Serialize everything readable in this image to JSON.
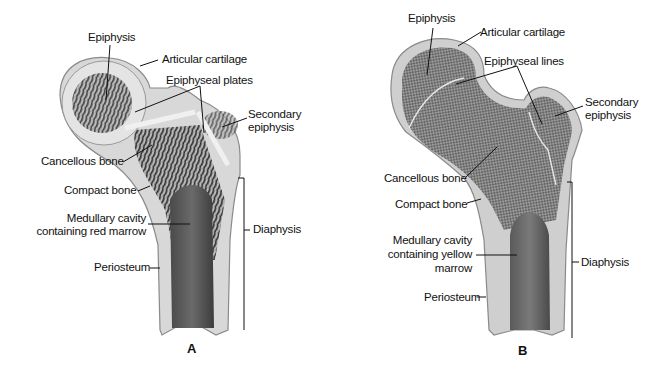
{
  "figure": {
    "panels": [
      {
        "letter": "A",
        "labels": {
          "epiphysis": "Epiphysis",
          "articular_cartilage": "Articular cartilage",
          "epiphyseal": "Epiphyseal plates",
          "secondary_epiphysis_1": "Secondary",
          "secondary_epiphysis_2": "epiphysis",
          "cancellous_bone": "Cancellous bone",
          "compact_bone": "Compact bone",
          "medullary_1": "Medullary cavity",
          "medullary_2": "containing red marrow",
          "periosteum": "Periosteum",
          "diaphysis": "Diaphysis"
        }
      },
      {
        "letter": "B",
        "labels": {
          "epiphysis": "Epiphysis",
          "articular_cartilage": "Articular cartilage",
          "epiphyseal": "Epiphyseal lines",
          "secondary_epiphysis_1": "Secondary",
          "secondary_epiphysis_2": "epiphysis",
          "cancellous_bone": "Cancellous bone",
          "compact_bone": "Compact bone",
          "medullary_1": "Medullary cavity",
          "medullary_2": "containing yellow",
          "medullary_3": "marrow",
          "periosteum": "Periosteum",
          "diaphysis": "Diaphysis"
        }
      }
    ]
  }
}
